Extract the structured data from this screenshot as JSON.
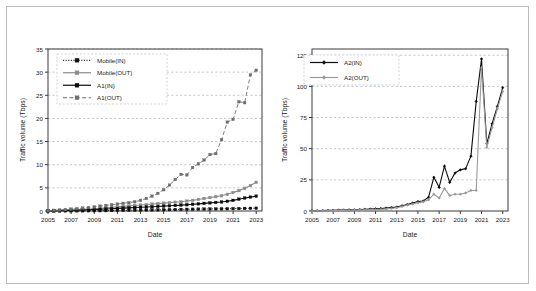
{
  "figure": {
    "background_color": "#ffffff",
    "frame_color": "#b9bcc0",
    "grid_color": "#9aa3ad",
    "axis_color": "#3a3a3a"
  },
  "chart_data": [
    {
      "id": "left",
      "type": "line",
      "title": "",
      "xlabel": "Date",
      "ylabel": "Traffic volume (Tbps)",
      "xlim": [
        2005,
        2023.5
      ],
      "ylim": [
        0,
        35
      ],
      "xticks": [
        "2005",
        "2007",
        "2009",
        "2011",
        "2013",
        "2015",
        "2017",
        "2019",
        "2021",
        "2023"
      ],
      "yticks": [
        "0",
        "5",
        "10",
        "15",
        "20",
        "25",
        "30",
        "35"
      ],
      "grid": true,
      "legend_position": "upper-left",
      "x": [
        2005,
        2005.5,
        2006,
        2006.5,
        2007,
        2007.5,
        2008,
        2008.5,
        2009,
        2009.5,
        2010,
        2010.5,
        2011,
        2011.5,
        2012,
        2012.5,
        2013,
        2013.5,
        2014,
        2014.5,
        2015,
        2015.5,
        2016,
        2016.5,
        2017,
        2017.5,
        2018,
        2018.5,
        2019,
        2019.5,
        2020,
        2020.5,
        2021,
        2021.5,
        2022,
        2022.5,
        2023
      ],
      "series": [
        {
          "name": "Mobile(IN)",
          "color": "#111111",
          "style": "dotted",
          "marker": "square",
          "values": [
            0.01,
            0.01,
            0.02,
            0.02,
            0.03,
            0.03,
            0.04,
            0.05,
            0.06,
            0.07,
            0.08,
            0.1,
            0.12,
            0.14,
            0.16,
            0.18,
            0.2,
            0.22,
            0.24,
            0.26,
            0.28,
            0.3,
            0.32,
            0.34,
            0.36,
            0.38,
            0.4,
            0.42,
            0.44,
            0.46,
            0.48,
            0.5,
            0.52,
            0.54,
            0.56,
            0.58,
            0.6
          ]
        },
        {
          "name": "Mobile(OUT)",
          "color": "#8c8c8c",
          "style": "solid",
          "marker": "square",
          "values": [
            0.05,
            0.08,
            0.12,
            0.16,
            0.22,
            0.28,
            0.35,
            0.42,
            0.5,
            0.6,
            0.7,
            0.8,
            0.9,
            1.0,
            1.1,
            1.2,
            1.3,
            1.4,
            1.5,
            1.6,
            1.7,
            1.8,
            1.9,
            2.0,
            2.15,
            2.3,
            2.5,
            2.7,
            2.9,
            3.1,
            3.3,
            3.6,
            4.0,
            4.4,
            4.9,
            5.5,
            6.2
          ]
        },
        {
          "name": "A1(IN)",
          "color": "#0b0b0b",
          "style": "solid",
          "marker": "square",
          "values": [
            0.03,
            0.05,
            0.07,
            0.1,
            0.13,
            0.17,
            0.21,
            0.26,
            0.31,
            0.37,
            0.43,
            0.5,
            0.56,
            0.62,
            0.68,
            0.74,
            0.8,
            0.86,
            0.92,
            0.98,
            1.05,
            1.12,
            1.2,
            1.28,
            1.36,
            1.45,
            1.55,
            1.65,
            1.75,
            1.85,
            1.95,
            2.1,
            2.3,
            2.55,
            2.8,
            3.0,
            3.2
          ]
        },
        {
          "name": "A1(OUT)",
          "color": "#6e6e6e",
          "style": "dashed",
          "marker": "square",
          "values": [
            0.1,
            0.15,
            0.22,
            0.3,
            0.4,
            0.5,
            0.62,
            0.75,
            0.9,
            1.05,
            1.2,
            1.35,
            1.5,
            1.65,
            1.8,
            2.0,
            2.3,
            2.7,
            3.2,
            3.8,
            4.6,
            5.6,
            6.8,
            7.9,
            7.8,
            9.4,
            10.2,
            11.0,
            12.2,
            12.4,
            15.4,
            19.2,
            19.8,
            23.6,
            23.4,
            29.4,
            30.4
          ]
        }
      ]
    },
    {
      "id": "right",
      "type": "line",
      "title": "",
      "xlabel": "Date",
      "ylabel": "Traffic volume (Tbps)",
      "xlim": [
        2005,
        2023.5
      ],
      "ylim": [
        0,
        130
      ],
      "xticks": [
        "2005",
        "2007",
        "2009",
        "2011",
        "2013",
        "2015",
        "2017",
        "2019",
        "2021",
        "2023"
      ],
      "yticks": [
        "0",
        "25",
        "50",
        "75",
        "100",
        "125"
      ],
      "grid": true,
      "legend_position": "upper-left",
      "x": [
        2005,
        2005.5,
        2006,
        2006.5,
        2007,
        2007.5,
        2008,
        2008.5,
        2009,
        2009.5,
        2010,
        2010.5,
        2011,
        2011.5,
        2012,
        2012.5,
        2013,
        2013.5,
        2014,
        2014.5,
        2015,
        2015.5,
        2016,
        2016.5,
        2017,
        2017.5,
        2018,
        2018.5,
        2019,
        2019.5,
        2020,
        2020.5,
        2021,
        2021.5,
        2022,
        2022.5,
        2023
      ],
      "series": [
        {
          "name": "A2(IN)",
          "color": "#0b0b0b",
          "style": "solid",
          "marker": "diamond",
          "values": [
            0.2,
            0.3,
            0.4,
            0.5,
            0.6,
            0.7,
            0.8,
            0.9,
            1.0,
            1.2,
            1.4,
            1.6,
            1.8,
            2.0,
            2.4,
            2.8,
            3.2,
            4.2,
            5.2,
            6.4,
            7.6,
            8.0,
            11.0,
            27.0,
            19.0,
            36.0,
            23.0,
            30.5,
            33.0,
            34.0,
            44.0,
            88.0,
            122.0,
            54.0,
            70.0,
            84.0,
            99.0
          ]
        },
        {
          "name": "A2(OUT)",
          "color": "#9a9a9a",
          "style": "solid",
          "marker": "diamond",
          "values": [
            0.1,
            0.15,
            0.2,
            0.25,
            0.3,
            0.4,
            0.5,
            0.6,
            0.7,
            0.8,
            0.9,
            1.0,
            1.1,
            1.3,
            1.6,
            2.0,
            2.6,
            3.6,
            4.6,
            5.6,
            6.6,
            7.4,
            9.0,
            13.5,
            10.5,
            18.0,
            12.5,
            13.5,
            13.5,
            14.5,
            16.5,
            16.5,
            115.0,
            51.0,
            67.0,
            82.0,
            96.0
          ]
        }
      ]
    }
  ]
}
